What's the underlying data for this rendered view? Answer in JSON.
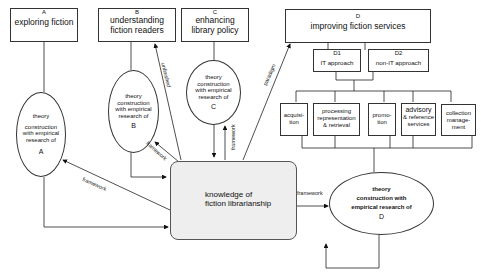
{
  "goals": {
    "A": {
      "letter": "A",
      "title": "exploring fiction"
    },
    "B": {
      "letter": "B",
      "title_line1": "understanding",
      "title_line2": "fiction readers"
    },
    "C": {
      "letter": "C",
      "title_line1": "enhancing",
      "title_line2": "library policy"
    },
    "D": {
      "letter": "D",
      "title": "improving fiction services"
    }
  },
  "approaches": {
    "D1": {
      "letter": "D1",
      "title": "IT approach"
    },
    "D2": {
      "letter": "D2",
      "title": "non-IT approach"
    }
  },
  "services": [
    {
      "line1": "acquisi-",
      "line2": "tion",
      "line3": ""
    },
    {
      "line1": "processing",
      "line2": "representation",
      "line3": "& retrieval"
    },
    {
      "line1": "promo-",
      "line2": "tion",
      "line3": ""
    },
    {
      "line1": "advisory",
      "line2": "& reference",
      "line3": "services"
    },
    {
      "line1": "collection",
      "line2": "manage-",
      "line3": "ment"
    }
  ],
  "theory_nodes": {
    "A": {
      "line1": "theory",
      "line2": "construction",
      "line3": "with empirical",
      "line4": "research of",
      "letter": "A"
    },
    "B": {
      "line1": "theory",
      "line2": "construction",
      "line3": "with empirical",
      "line4": "research of",
      "letter": "B"
    },
    "C": {
      "line1": "theory",
      "line2": "construction",
      "line3": "with empirical",
      "line4": "research of",
      "letter": "C"
    },
    "D": {
      "line1": "theory",
      "line2": "construction with",
      "line3": "empirical research of",
      "letter": "D"
    }
  },
  "knowledge": {
    "line1": "knowledge of",
    "line2": "fiction librarianship"
  },
  "edge_labels": {
    "unfinished": "unfinished",
    "paradigm": "paradigm",
    "framework_A": "framework",
    "framework_B": "framework",
    "framework_C": "framework",
    "framework_D": "framework"
  }
}
